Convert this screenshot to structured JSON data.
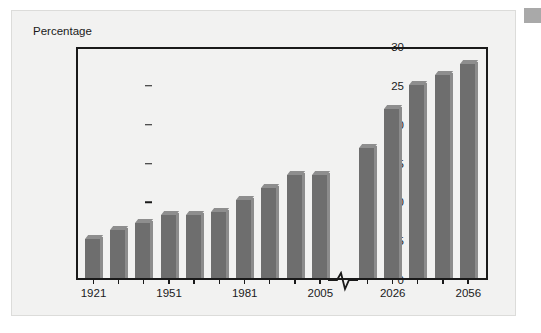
{
  "figure": {
    "background_color": "#f2f2f1",
    "bar_color": "#6e6e6e",
    "axis_color": "#1a1a1a",
    "corner_mark_color": "#a9a9a9"
  },
  "chart_data": {
    "type": "bar",
    "title": "",
    "xlabel": "",
    "ylabel": "Percentage",
    "ylim": [
      0,
      30
    ],
    "yticks": [
      0,
      5,
      10,
      15,
      20,
      25,
      30
    ],
    "ytick_labels": [
      "0",
      "5",
      "10",
      "15",
      "20",
      "25",
      "30"
    ],
    "grid": false,
    "legend": null,
    "axis_break": {
      "present": true,
      "between_categories": [
        "2005",
        "2011"
      ],
      "symbol": "zigzag"
    },
    "categories": [
      "1921",
      "1931",
      "1941",
      "1951",
      "1961",
      "1971",
      "1981",
      "1991",
      "2001",
      "2005",
      "2011",
      "2026",
      "2036",
      "2046",
      "2056"
    ],
    "xtick_labels": [
      "1921",
      "1951",
      "1981",
      "2005",
      "2026",
      "2056"
    ],
    "xtick_category_index": [
      0,
      3,
      6,
      9,
      11,
      14
    ],
    "values": [
      5.0,
      6.2,
      7.1,
      8.1,
      8.1,
      8.5,
      10.0,
      11.6,
      13.2,
      13.2,
      16.8,
      21.7,
      24.9,
      26.2,
      27.6
    ],
    "series": [
      {
        "name": "Percentage",
        "values": [
          5.0,
          6.2,
          7.1,
          8.1,
          8.1,
          8.5,
          10.0,
          11.6,
          13.2,
          13.2,
          16.8,
          21.7,
          24.9,
          26.2,
          27.6
        ]
      }
    ]
  }
}
